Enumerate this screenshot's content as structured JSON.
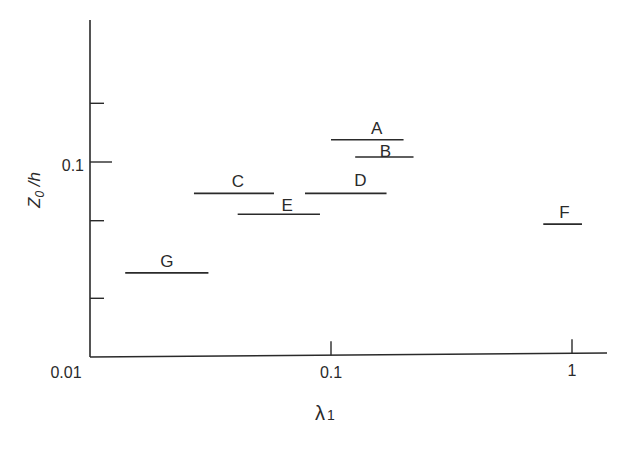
{
  "chart_data": {
    "type": "scatter",
    "title": "",
    "xlabel": "λ1",
    "ylabel": "Z0 /h",
    "xscale": "log",
    "yscale": "log",
    "xlim": [
      0.01,
      1.3
    ],
    "ylim": [
      0.01,
      0.5
    ],
    "x_ticks": [
      0.01,
      0.1,
      1
    ],
    "x_tick_labels": [
      "0.01",
      "0.1",
      "1"
    ],
    "y_ticks": [
      0.02,
      0.05,
      0.1,
      0.2
    ],
    "y_tick_labels": [
      "",
      "",
      "0.1",
      ""
    ],
    "grid": false,
    "legend": "none",
    "series": [
      {
        "name": "A",
        "x_range": [
          0.1,
          0.2
        ],
        "y": 0.13
      },
      {
        "name": "B",
        "x_range": [
          0.126,
          0.22
        ],
        "y": 0.106
      },
      {
        "name": "C",
        "x_range": [
          0.027,
          0.058
        ],
        "y": 0.069
      },
      {
        "name": "D",
        "x_range": [
          0.078,
          0.17
        ],
        "y": 0.069
      },
      {
        "name": "E",
        "x_range": [
          0.041,
          0.09
        ],
        "y": 0.054
      },
      {
        "name": "F",
        "x_range": [
          0.76,
          1.1
        ],
        "y": 0.048
      },
      {
        "name": "G",
        "x_range": [
          0.014,
          0.031
        ],
        "y": 0.027
      }
    ]
  },
  "axes": {
    "origin_label": "0.01",
    "y_label_main": "Z",
    "y_label_sub": "0",
    "y_label_tail": " /h",
    "x_label_main": "λ",
    "x_label_sub": "1"
  },
  "style": {
    "line_color": "#2a2a2a",
    "background": "#ffffff"
  }
}
